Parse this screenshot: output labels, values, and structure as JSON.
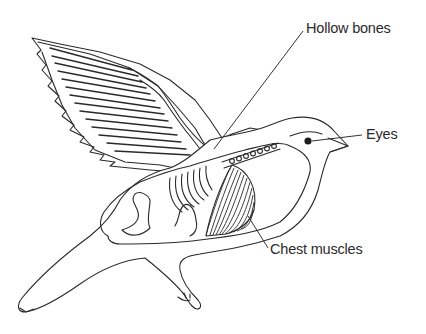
{
  "diagram": {
    "labels": [
      {
        "id": "hollow-bones",
        "text": "Hollow bones"
      },
      {
        "id": "eyes",
        "text": "Eyes"
      },
      {
        "id": "chest-muscles",
        "text": "Chest muscles"
      }
    ],
    "colors": {
      "line": "#2a2a2a",
      "background": "#ffffff",
      "text": "#2b2b2b"
    }
  }
}
